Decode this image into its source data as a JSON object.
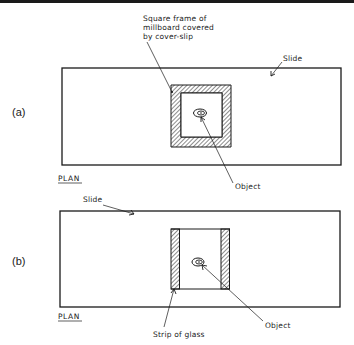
{
  "figure": {
    "panel_a": {
      "panel_label": "(a)",
      "view_label": "PLAN",
      "frame_label_lines": [
        "Square frame of",
        "millboard covered",
        "by cover-slip"
      ],
      "slide_label": "Slide",
      "object_label": "Object"
    },
    "panel_b": {
      "panel_label": "(b)",
      "view_label": "PLAN",
      "slide_label": "Slide",
      "strip_label": "Strip of glass",
      "object_label": "Object"
    }
  },
  "colors": {
    "ink": "#1a1a1a",
    "background": "#ffffff"
  }
}
